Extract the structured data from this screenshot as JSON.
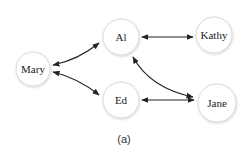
{
  "diagram": {
    "caption": "(a)",
    "nodes": [
      {
        "id": "mary",
        "label": "Mary",
        "cx": 33,
        "cy": 69,
        "r": 17
      },
      {
        "id": "al",
        "label": "Al",
        "cx": 121,
        "cy": 37,
        "r": 18
      },
      {
        "id": "kathy",
        "label": "Kathy",
        "cx": 214,
        "cy": 35,
        "r": 18
      },
      {
        "id": "ed",
        "label": "Ed",
        "cx": 121,
        "cy": 100,
        "r": 18
      },
      {
        "id": "jane",
        "label": "Jane",
        "cx": 217,
        "cy": 103,
        "r": 19
      }
    ],
    "edges": [
      {
        "from": "Mary",
        "to": "Al",
        "direction": "bidirectional"
      },
      {
        "from": "Mary",
        "to": "Ed",
        "direction": "bidirectional"
      },
      {
        "from": "Al",
        "to": "Kathy",
        "direction": "bidirectional"
      },
      {
        "from": "Al",
        "to": "Jane",
        "direction": "bidirectional"
      },
      {
        "from": "Ed",
        "to": "Jane",
        "direction": "bidirectional"
      }
    ],
    "colors": {
      "node_fill": "#ffffff",
      "node_stroke": "#d8d8d8",
      "edge": "#222222",
      "text": "#222222"
    }
  }
}
